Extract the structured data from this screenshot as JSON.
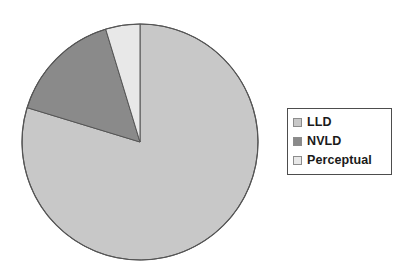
{
  "chart_data": {
    "type": "pie",
    "title": "",
    "categories": [
      "LLD",
      "NVLD",
      "Perceptual"
    ],
    "values": [
      79.7,
      15.6,
      4.7
    ],
    "value_unit": "percent",
    "colors": [
      "#c8c8c8",
      "#8a8a8a",
      "#e8e8e8"
    ],
    "slice_angles_deg": [
      287.0,
      56.0,
      17.0
    ],
    "start_angle_deg": 0,
    "direction": "clockwise",
    "legend_position": "right",
    "grid": false,
    "xlabel": "",
    "ylabel": ""
  },
  "pie": {
    "center_x": 140,
    "center_y": 142,
    "radius": 118,
    "outline_color": "#555555",
    "background_color": "#ffffff",
    "slices": [
      {
        "label": "LLD",
        "value": 79.7,
        "color": "#c8c8c8"
      },
      {
        "label": "NVLD",
        "value": 15.6,
        "color": "#8a8a8a"
      },
      {
        "label": "Perceptual",
        "value": 4.7,
        "color": "#e8e8e8"
      }
    ]
  },
  "legend": {
    "items": [
      {
        "label": "LLD",
        "color": "#c8c8c8"
      },
      {
        "label": "NVLD",
        "color": "#8a8a8a"
      },
      {
        "label": "Perceptual",
        "color": "#e8e8e8"
      }
    ],
    "border_color": "#4d4d4d",
    "background_color": "#ffffff"
  }
}
